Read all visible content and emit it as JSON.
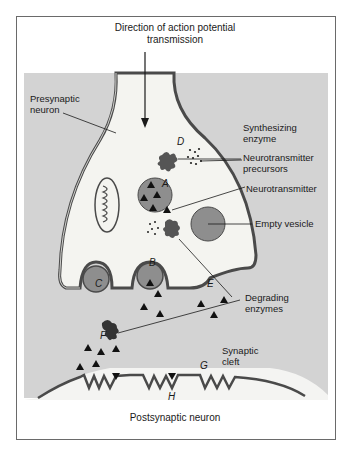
{
  "figure": {
    "title_line1": "Direction of action potential",
    "title_line2": "transmission",
    "postsynaptic_label": "Postsynaptic neuron"
  },
  "labels": {
    "presynaptic_line1": "Presynaptic",
    "presynaptic_line2": "neuron",
    "synth_line1": "Synthesizing",
    "synth_line2": "enzyme",
    "precursors_line1": "Neurotransmitter",
    "precursors_line2": "precursors",
    "neurotransmitter": "Neurotransmitter",
    "empty_vesicle": "Empty vesicle",
    "degrading_line1": "Degrading",
    "degrading_line2": "enzymes",
    "cleft_line1": "Synaptic",
    "cleft_line2": "cleft"
  },
  "letters": {
    "A": "A",
    "B": "B",
    "C": "C",
    "D": "D",
    "E": "E",
    "F": "F",
    "G": "G",
    "H": "H"
  },
  "colors": {
    "background": "#d3d3d3",
    "cytoplasm": "#f4f4f0",
    "vesicle": "#8e8e8e",
    "membrane": "#4a4a4a",
    "ink": "#1a1a1a"
  }
}
